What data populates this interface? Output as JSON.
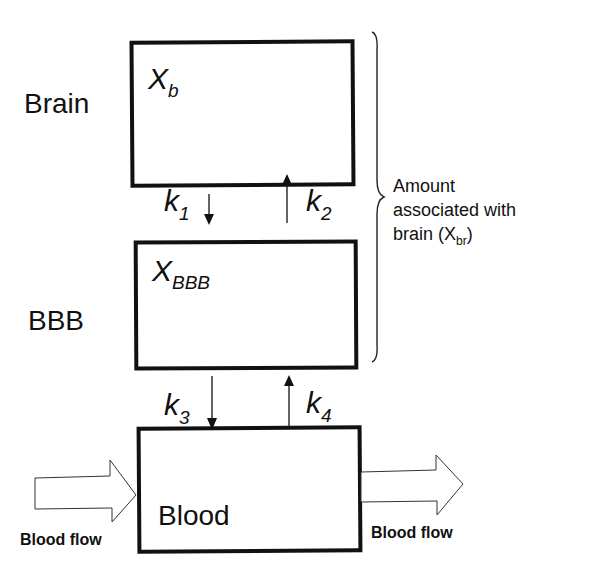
{
  "diagram": {
    "compartments": [
      {
        "id": "brain",
        "side_label": "Brain",
        "variable": "X",
        "subscript": "b"
      },
      {
        "id": "bbb",
        "side_label": "BBB",
        "variable": "X",
        "subscript": "BBB"
      },
      {
        "id": "blood",
        "inner_label": "Blood"
      }
    ],
    "rate_constants": [
      {
        "symbol": "k",
        "subscript": "1",
        "direction": "down",
        "from": "Brain",
        "to": "BBB"
      },
      {
        "symbol": "k",
        "subscript": "2",
        "direction": "up",
        "from": "BBB",
        "to": "Brain"
      },
      {
        "symbol": "k",
        "subscript": "3",
        "direction": "down",
        "from": "BBB",
        "to": "Blood"
      },
      {
        "symbol": "k",
        "subscript": "4",
        "direction": "up",
        "from": "Blood",
        "to": "BBB"
      }
    ],
    "bracket": {
      "line1": "Amount",
      "line2": "associated with",
      "line3_prefix": "brain (X",
      "line3_sub": "br",
      "line3_suffix": ")"
    },
    "flows": {
      "in_label": "Blood flow",
      "out_label": "Blood flow"
    }
  }
}
